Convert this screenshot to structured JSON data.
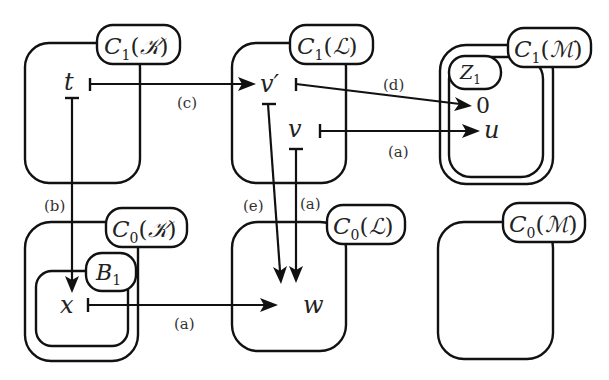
{
  "complexes": {
    "C1K": {
      "base": "C",
      "sub": "1",
      "arg": "𝒦"
    },
    "C1L": {
      "base": "C",
      "sub": "1",
      "arg": "ℒ"
    },
    "C1M": {
      "base": "C",
      "sub": "1",
      "arg": "ℳ"
    },
    "C0K": {
      "base": "C",
      "sub": "0",
      "arg": "𝒦"
    },
    "C0L": {
      "base": "C",
      "sub": "0",
      "arg": "ℒ"
    },
    "C0M": {
      "base": "C",
      "sub": "0",
      "arg": "ℳ"
    }
  },
  "subsets": {
    "Z1": {
      "base": "Z",
      "sub": "1"
    },
    "B1": {
      "base": "B",
      "sub": "1"
    }
  },
  "nodes": {
    "t": "t",
    "v_prime": "v′",
    "v": "v",
    "zero": "0",
    "u": "u",
    "x": "x",
    "w": "w"
  },
  "edges": {
    "t_to_vprime": {
      "from": "t",
      "to": "v′",
      "label": "(c)"
    },
    "t_to_x": {
      "from": "t",
      "to": "x",
      "label": "(b)"
    },
    "vprime_to_zero": {
      "from": "v′",
      "to": "0",
      "label": "(d)"
    },
    "v_to_u": {
      "from": "v",
      "to": "u",
      "label": "(a)"
    },
    "vprime_to_w": {
      "from": "v′",
      "to": "w",
      "label": "(e)"
    },
    "v_to_w": {
      "from": "v",
      "to": "w",
      "label": "(a)"
    },
    "x_to_w": {
      "from": "x",
      "to": "w",
      "label": "(a)"
    }
  }
}
